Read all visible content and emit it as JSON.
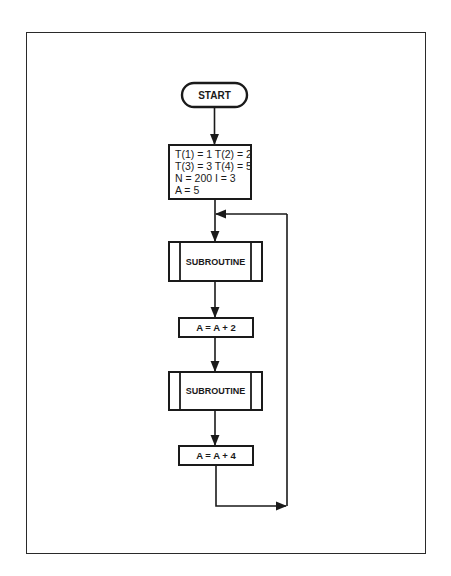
{
  "flowchart": {
    "start": {
      "label": "START"
    },
    "init": {
      "lines": [
        "T(1) = 1   T(2) = 2",
        "T(3) = 3   T(4) = 5",
        "N = 200   I = 3",
        "A = 5"
      ]
    },
    "subroutine_1": {
      "label": "SUBROUTINE"
    },
    "step_1": {
      "label": "A = A + 2"
    },
    "subroutine_2": {
      "label": "SUBROUTINE"
    },
    "step_2": {
      "label": "A = A + 4"
    },
    "loop": {
      "description": "return to before first SUBROUTINE"
    }
  },
  "colors": {
    "stroke": "#1a1a1a",
    "background": "#ffffff"
  }
}
